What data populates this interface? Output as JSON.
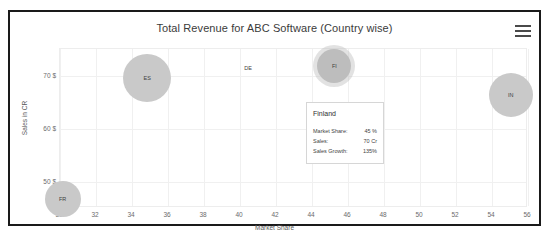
{
  "card": {
    "title": "Total Revenue for ABC Software (Country wise)",
    "menu_icon": "hamburger-menu-icon"
  },
  "chart_data": {
    "type": "scatter",
    "title": "Total Revenue for ABC Software (Country wise)",
    "xlabel": "Market Share",
    "ylabel": "Sales in CR",
    "xlim": [
      30,
      56
    ],
    "ylim": [
      45,
      75
    ],
    "xticks": [
      "30",
      "32",
      "34",
      "36",
      "38",
      "40",
      "42",
      "44",
      "46",
      "48",
      "50",
      "52",
      "54",
      "56"
    ],
    "yticks": [
      "50 $",
      "60 $",
      "70 $"
    ],
    "grid": true,
    "legend": "none",
    "points": [
      {
        "label": "FR",
        "x": 30.2,
        "y": 46.6,
        "size": 18,
        "state": "normal"
      },
      {
        "label": "ES",
        "x": 34.9,
        "y": 69.3,
        "size": 24,
        "state": "normal"
      },
      {
        "label": "DE",
        "x": 40.5,
        "y": 71.2,
        "size": 2,
        "state": "normal"
      },
      {
        "label": "FI",
        "x": 45.3,
        "y": 71.6,
        "size": 17,
        "state": "active"
      },
      {
        "label": "IN",
        "x": 55.1,
        "y": 66.2,
        "size": 22,
        "state": "normal"
      }
    ]
  },
  "tooltip": {
    "title": "Finland",
    "rows": [
      {
        "key": "Market Share:",
        "value": "45 %"
      },
      {
        "key": "Sales:",
        "value": "70 Cr"
      },
      {
        "key": "Sales Growth:",
        "value": "135%"
      }
    ]
  }
}
